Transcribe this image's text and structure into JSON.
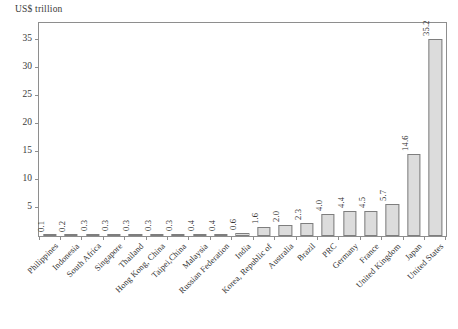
{
  "chart_data": {
    "type": "bar",
    "title": "",
    "subtitle": "",
    "xlabel": "",
    "ylabel": "US$ trillion",
    "ylim": [
      0,
      38
    ],
    "ytick_labels": [
      "5",
      "10",
      "15",
      "20",
      "25",
      "30",
      "35"
    ],
    "ytick_values": [
      5,
      10,
      15,
      20,
      25,
      30,
      35
    ],
    "grid": false,
    "legend": "none",
    "bar_fill_color": "#dcdcdc",
    "bar_edge_color": "#7e7e7e",
    "axis_color": "#8e8e8e",
    "text_color": "#303030",
    "categories": [
      "Philippines",
      "Indonesia",
      "South Africa",
      "Singapore",
      "Thailand",
      "Hong Kong, China",
      "Taipei,China",
      "Malaysia",
      "Russian Federation",
      "India",
      "Korea, Republic of",
      "Australia",
      "Brazil",
      "PRC",
      "Germany",
      "France",
      "United Kingdom",
      "Japan",
      "United States"
    ],
    "values": [
      0.1,
      0.2,
      0.3,
      0.3,
      0.3,
      0.3,
      0.3,
      0.4,
      0.4,
      0.6,
      1.6,
      2.0,
      2.3,
      4.0,
      4.4,
      4.5,
      5.7,
      14.6,
      35.2
    ],
    "value_labels": [
      "0.1",
      "0.2",
      "0.3",
      "0.3",
      "0.3",
      "0.3",
      "0.3",
      "0.4",
      "0.4",
      "0.6",
      "1.6",
      "2.0",
      "2.3",
      "4.0",
      "4.4",
      "4.5",
      "5.7",
      "14.6",
      "35.2"
    ]
  }
}
